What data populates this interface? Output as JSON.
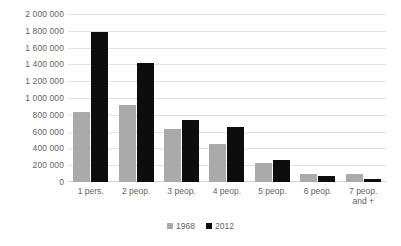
{
  "chart_data": {
    "type": "bar",
    "title": "",
    "xlabel": "",
    "ylabel": "",
    "categories": [
      "1 pers.",
      "2 peop.",
      "3 peop.",
      "4 peop.",
      "5 peop.",
      "6 peop.",
      "7 peop.\nand +"
    ],
    "series": [
      {
        "name": "1968",
        "color": "#aaaaaa",
        "values": [
          830000,
          920000,
          635000,
          450000,
          230000,
          100000,
          95000
        ]
      },
      {
        "name": "2012",
        "color": "#0d0d0d",
        "values": [
          1790000,
          1420000,
          740000,
          650000,
          265000,
          75000,
          35000
        ]
      }
    ],
    "ylim": [
      0,
      2000000
    ],
    "ytick_step": 200000,
    "ytick_labels": [
      "2 000 000",
      "1 800 000",
      "1 600 000",
      "1 400 000",
      "1 200 000",
      "1 000 000",
      "800 000",
      "600 000",
      "400 000",
      "200 000",
      "0"
    ],
    "ytick_values": [
      2000000,
      1800000,
      1600000,
      1400000,
      1200000,
      1000000,
      800000,
      600000,
      400000,
      200000,
      0
    ],
    "grid": true,
    "legend_position": "bottom",
    "legend": [
      "1968",
      "2012"
    ]
  }
}
